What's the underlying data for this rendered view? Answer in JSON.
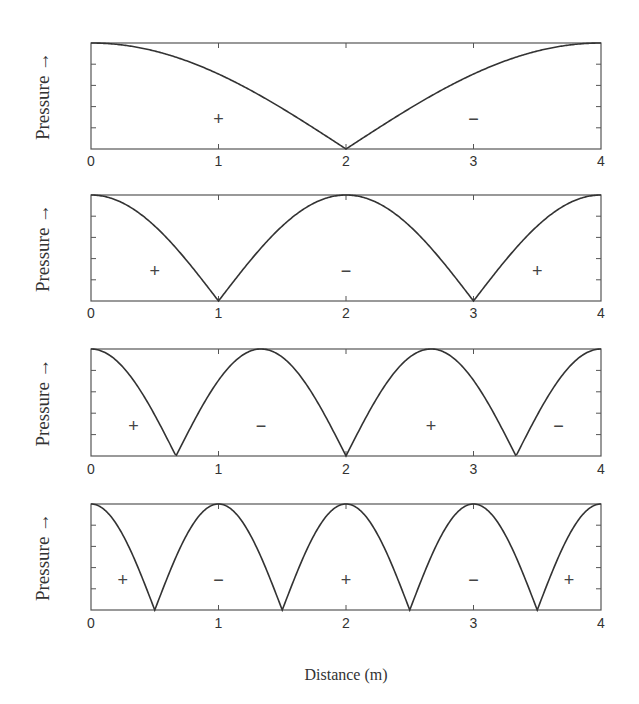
{
  "chart_data": {
    "type": "line",
    "layout": "4 vertically stacked subplots sharing x-axis",
    "xlabel": "Distance (m)",
    "ylabel": "Pressure →",
    "xlim": [
      0,
      4
    ],
    "xticks": [
      "0",
      "1",
      "2",
      "3",
      "4"
    ],
    "yticks_count": 6,
    "grid": false,
    "legend": null,
    "subplots": [
      {
        "index": 1,
        "description": "Absolute pressure of standing wave, mode 1",
        "harmonic": 1,
        "nodes_x": [
          2
        ],
        "antinodes_x": [
          0,
          4
        ],
        "curve": "|cos(pi*x/4)|",
        "x": [
          0,
          0.5,
          1,
          1.5,
          2,
          2.5,
          3,
          3.5,
          4
        ],
        "y": [
          1.0,
          0.92,
          0.71,
          0.38,
          0.0,
          0.38,
          0.71,
          0.92,
          1.0
        ],
        "signs": [
          {
            "x": 1,
            "label": "+"
          },
          {
            "x": 3,
            "label": "−"
          }
        ]
      },
      {
        "index": 2,
        "description": "Absolute pressure of standing wave, mode 2",
        "harmonic": 2,
        "nodes_x": [
          1,
          3
        ],
        "antinodes_x": [
          0,
          2,
          4
        ],
        "curve": "|cos(pi*x/2)|",
        "x": [
          0,
          0.5,
          1,
          1.5,
          2,
          2.5,
          3,
          3.5,
          4
        ],
        "y": [
          1.0,
          0.71,
          0.0,
          0.71,
          1.0,
          0.71,
          0.0,
          0.71,
          1.0
        ],
        "signs": [
          {
            "x": 0.5,
            "label": "+"
          },
          {
            "x": 2,
            "label": "−"
          },
          {
            "x": 3.5,
            "label": "+"
          }
        ]
      },
      {
        "index": 3,
        "description": "Absolute pressure of standing wave, mode 3",
        "harmonic": 3,
        "nodes_x": [
          0.667,
          2,
          3.333
        ],
        "antinodes_x": [
          0,
          1.333,
          2.667,
          4
        ],
        "curve": "|cos(3*pi*x/4)|",
        "x": [
          0,
          0.333,
          0.667,
          1,
          1.333,
          1.667,
          2,
          2.333,
          2.667,
          3,
          3.333,
          3.667,
          4
        ],
        "y": [
          1.0,
          0.71,
          0.0,
          0.71,
          1.0,
          0.71,
          0.0,
          0.71,
          1.0,
          0.71,
          0.0,
          0.71,
          1.0
        ],
        "signs": [
          {
            "x": 0.333,
            "label": "+"
          },
          {
            "x": 1.333,
            "label": "−"
          },
          {
            "x": 2.667,
            "label": "+"
          },
          {
            "x": 3.667,
            "label": "−"
          }
        ]
      },
      {
        "index": 4,
        "description": "Absolute pressure of standing wave, mode 4",
        "harmonic": 4,
        "nodes_x": [
          0.5,
          1.5,
          2.5,
          3.5
        ],
        "antinodes_x": [
          0,
          1,
          2,
          3,
          4
        ],
        "curve": "|cos(pi*x)|",
        "x": [
          0,
          0.25,
          0.5,
          0.75,
          1,
          1.25,
          1.5,
          1.75,
          2,
          2.25,
          2.5,
          2.75,
          3,
          3.25,
          3.5,
          3.75,
          4
        ],
        "y": [
          1.0,
          0.71,
          0.0,
          0.71,
          1.0,
          0.71,
          0.0,
          0.71,
          1.0,
          0.71,
          0.0,
          0.71,
          1.0,
          0.71,
          0.0,
          0.71,
          1.0
        ],
        "signs": [
          {
            "x": 0.25,
            "label": "+"
          },
          {
            "x": 1,
            "label": "−"
          },
          {
            "x": 2,
            "label": "+"
          },
          {
            "x": 3,
            "label": "−"
          },
          {
            "x": 3.75,
            "label": "+"
          }
        ]
      }
    ]
  },
  "labels": {
    "ylabel": "Pressure →",
    "xlabel": "Distance (m)",
    "xticks": [
      "0",
      "1",
      "2",
      "3",
      "4"
    ]
  },
  "style": {
    "line_color": "#333333",
    "axis_color": "#555555",
    "background": "#ffffff"
  }
}
